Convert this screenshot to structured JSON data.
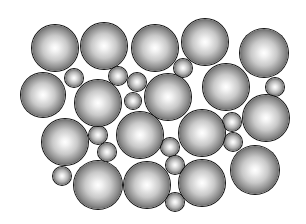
{
  "illustration": {
    "description": "Packed arrangement of large and small shaded spheres on a white background",
    "background_color": "#ffffff",
    "sphere_shading": {
      "highlight": "#ffffff",
      "mid": "#9a9a9a",
      "edge": "#0a0a0a"
    },
    "large_spheres": [
      {
        "cx": 55,
        "cy": 48,
        "r": 23
      },
      {
        "cx": 104,
        "cy": 46,
        "r": 23
      },
      {
        "cx": 155,
        "cy": 48,
        "r": 23
      },
      {
        "cx": 205,
        "cy": 42,
        "r": 23
      },
      {
        "cx": 264,
        "cy": 53,
        "r": 24
      },
      {
        "cx": 43,
        "cy": 95,
        "r": 22
      },
      {
        "cx": 98,
        "cy": 103,
        "r": 23
      },
      {
        "cx": 168,
        "cy": 97,
        "r": 23
      },
      {
        "cx": 226,
        "cy": 87,
        "r": 23
      },
      {
        "cx": 65,
        "cy": 142,
        "r": 23
      },
      {
        "cx": 140,
        "cy": 135,
        "r": 23
      },
      {
        "cx": 202,
        "cy": 133,
        "r": 23
      },
      {
        "cx": 266,
        "cy": 118,
        "r": 23
      },
      {
        "cx": 98,
        "cy": 185,
        "r": 24
      },
      {
        "cx": 147,
        "cy": 185,
        "r": 23
      },
      {
        "cx": 202,
        "cy": 183,
        "r": 23
      },
      {
        "cx": 255,
        "cy": 170,
        "r": 24
      }
    ],
    "small_spheres": [
      {
        "cx": 74,
        "cy": 78,
        "r": 9
      },
      {
        "cx": 118,
        "cy": 76,
        "r": 9
      },
      {
        "cx": 137,
        "cy": 82,
        "r": 9
      },
      {
        "cx": 133,
        "cy": 101,
        "r": 8
      },
      {
        "cx": 183,
        "cy": 68,
        "r": 9
      },
      {
        "cx": 275,
        "cy": 87,
        "r": 9
      },
      {
        "cx": 98,
        "cy": 135,
        "r": 9
      },
      {
        "cx": 107,
        "cy": 152,
        "r": 9
      },
      {
        "cx": 62,
        "cy": 176,
        "r": 9
      },
      {
        "cx": 170,
        "cy": 147,
        "r": 9
      },
      {
        "cx": 175,
        "cy": 165,
        "r": 9
      },
      {
        "cx": 175,
        "cy": 202,
        "r": 9
      },
      {
        "cx": 232,
        "cy": 122,
        "r": 9
      },
      {
        "cx": 233,
        "cy": 142,
        "r": 9
      }
    ]
  }
}
